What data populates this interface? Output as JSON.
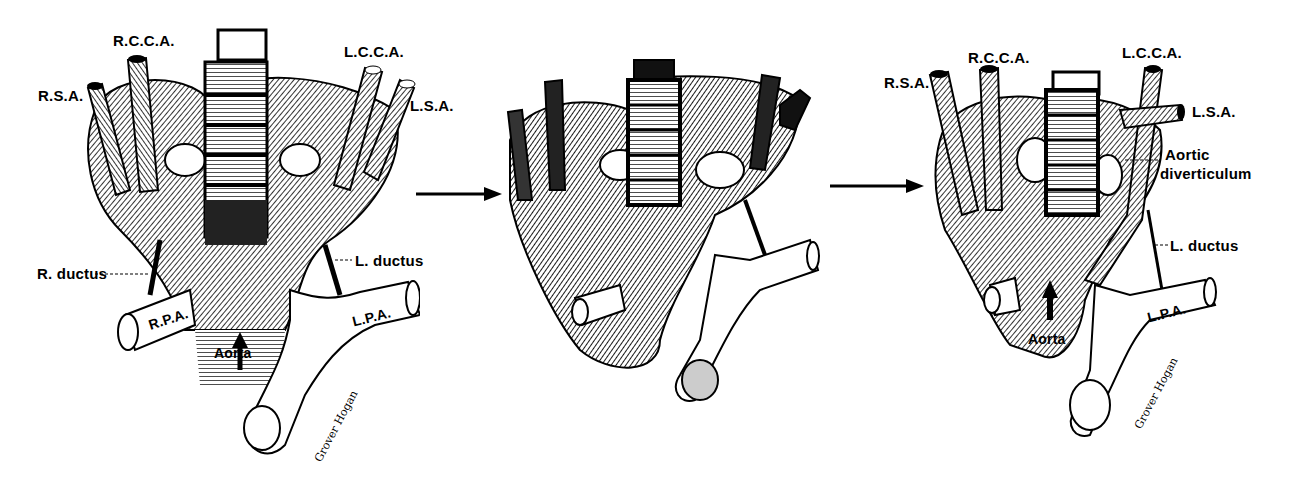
{
  "figure": {
    "colors": {
      "ink": "#000000",
      "paper": "#ffffff"
    },
    "panels": [
      {
        "id": "panel-1",
        "labels": {
          "rsa": "R.S.A.",
          "rcca": "R.C.C.A.",
          "lcca": "L.C.C.A.",
          "lsa": "L.S.A.",
          "r_ductus": "R. ductus",
          "l_ductus": "L. ductus",
          "rpa": "R.P.A.",
          "lpa": "L.P.A.",
          "aorta": "Aorta"
        },
        "signature": "Grover Hogan"
      },
      {
        "id": "panel-2",
        "labels": {}
      },
      {
        "id": "panel-3",
        "labels": {
          "rsa": "R.S.A.",
          "rcca": "R.C.C.A.",
          "lcca": "L.C.C.A.",
          "lsa": "L.S.A.",
          "aortic_div_1": "Aortic",
          "aortic_div_2": "diverticulum",
          "l_ductus": "L. ductus",
          "lpa": "L.P.A.",
          "aorta": "Aorta"
        },
        "signature": "Grover Hogan"
      }
    ],
    "arrows": [
      {
        "id": "arrow-1",
        "direction": "right"
      },
      {
        "id": "arrow-2",
        "direction": "right"
      }
    ]
  }
}
